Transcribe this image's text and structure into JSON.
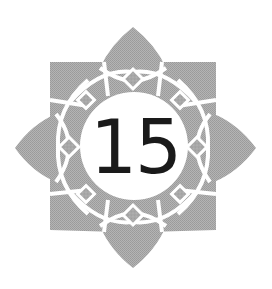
{
  "emblem": {
    "number": "15",
    "shape": "eight-petal-lotus-rosette",
    "colors": {
      "petal_fill": "#a8a8a8",
      "lattice_lines": "#ffffff",
      "center_circle": "#ffffff",
      "number_text": "#1a1a1a",
      "background": "#ffffff"
    }
  }
}
